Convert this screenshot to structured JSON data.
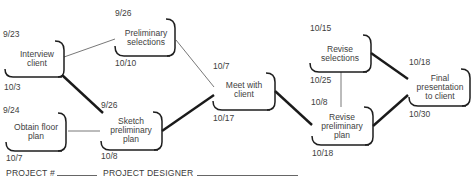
{
  "diagram": {
    "type": "critical-path-schedule",
    "tasks": [
      {
        "id": "interview",
        "lines": [
          "Interview",
          "client"
        ],
        "start": "9/23",
        "end": "10/3"
      },
      {
        "id": "prelim_sel",
        "lines": [
          "Preliminary",
          "selections"
        ],
        "start": "9/26",
        "end": "10/10"
      },
      {
        "id": "floor_plan",
        "lines": [
          "Obtain floor",
          "plan"
        ],
        "start": "9/24",
        "end": "10/7"
      },
      {
        "id": "sketch",
        "lines": [
          "Sketch",
          "preliminary",
          "plan"
        ],
        "start": "9/26",
        "end": "10/8"
      },
      {
        "id": "meet",
        "lines": [
          "Meet with",
          "client"
        ],
        "start": "10/7",
        "end": "10/17"
      },
      {
        "id": "revise_sel",
        "lines": [
          "Revise",
          "selections"
        ],
        "start": "10/15",
        "end": "10/25"
      },
      {
        "id": "revise_plan",
        "lines": [
          "Revise",
          "preliminary",
          "plan"
        ],
        "start": "10/8",
        "end": "10/18"
      },
      {
        "id": "final",
        "lines": [
          "Final",
          "presentation",
          "to client"
        ],
        "start": "10/18",
        "end": "10/30"
      }
    ],
    "connections": [
      {
        "from": "interview",
        "to": "prelim_sel",
        "critical": false
      },
      {
        "from": "interview",
        "to": "sketch",
        "critical": true
      },
      {
        "from": "prelim_sel",
        "to": "meet",
        "critical": false
      },
      {
        "from": "floor_plan",
        "to": "sketch",
        "critical": false
      },
      {
        "from": "sketch",
        "to": "meet",
        "critical": true
      },
      {
        "from": "meet",
        "to": "revise_plan",
        "critical": true
      },
      {
        "from": "revise_sel",
        "to": "revise_plan",
        "critical": false
      },
      {
        "from": "revise_sel",
        "to": "final",
        "critical": true
      },
      {
        "from": "revise_plan",
        "to": "final",
        "critical": true
      }
    ]
  },
  "footer": {
    "project_number_label": "PROJECT #",
    "project_designer_label": "PROJECT DESIGNER"
  }
}
